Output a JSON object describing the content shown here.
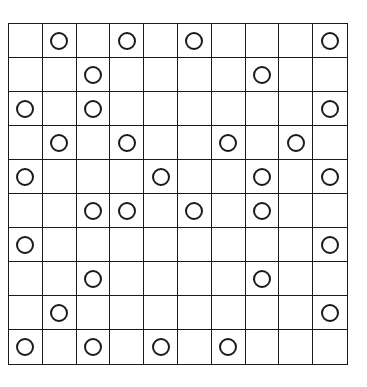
{
  "board": {
    "rows": 10,
    "cols": 10,
    "line_color": "#1a1a1a",
    "circle_color": "#1a1a1a",
    "grid": [
      [
        0,
        1,
        0,
        1,
        0,
        1,
        0,
        0,
        0,
        1
      ],
      [
        0,
        0,
        1,
        0,
        0,
        0,
        0,
        1,
        0,
        0
      ],
      [
        1,
        0,
        1,
        0,
        0,
        0,
        0,
        0,
        0,
        1
      ],
      [
        0,
        1,
        0,
        1,
        0,
        0,
        1,
        0,
        1,
        0
      ],
      [
        1,
        0,
        0,
        0,
        1,
        0,
        0,
        1,
        0,
        1
      ],
      [
        0,
        0,
        1,
        1,
        0,
        1,
        0,
        1,
        0,
        0
      ],
      [
        1,
        0,
        0,
        0,
        0,
        0,
        0,
        0,
        0,
        1
      ],
      [
        0,
        0,
        1,
        0,
        0,
        0,
        0,
        1,
        0,
        0
      ],
      [
        0,
        1,
        0,
        0,
        0,
        0,
        0,
        0,
        0,
        1
      ],
      [
        1,
        0,
        1,
        0,
        1,
        0,
        1,
        0,
        0,
        0
      ]
    ],
    "cell_symbol": "circle-icon"
  }
}
